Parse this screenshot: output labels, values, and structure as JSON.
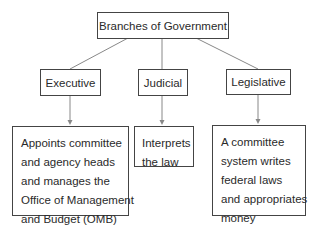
{
  "diagram": {
    "title": "Branches of Government",
    "branches": [
      {
        "name": "Executive",
        "description_lines": [
          "Appoints committee",
          "and agency heads",
          "and manages the",
          "Office of Management",
          "and Budget (OMB)"
        ]
      },
      {
        "name": "Judicial",
        "description_lines": [
          "Interprets",
          "the law"
        ]
      },
      {
        "name": "Legislative",
        "description_lines": [
          "A committee",
          "system writes",
          "federal laws",
          "and appropriates",
          "money"
        ]
      }
    ],
    "colors": {
      "line": "#777777",
      "border": "#444444",
      "text": "#2a2a2a"
    }
  }
}
